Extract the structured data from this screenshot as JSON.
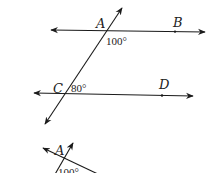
{
  "diagram": {
    "type": "parallel-lines-transversal",
    "lines": [
      {
        "name": "line-AB",
        "points": [
          "A",
          "B"
        ]
      },
      {
        "name": "line-CD",
        "points": [
          "C",
          "D"
        ]
      },
      {
        "name": "transversal",
        "points": [
          "A",
          "C"
        ]
      }
    ],
    "labels": {
      "A": "A",
      "B": "B",
      "C": "C",
      "D": "D"
    },
    "angles": {
      "angle_A": "100°",
      "angle_C": "80°"
    },
    "fragment": {
      "label_A": "A",
      "angle": "100°"
    }
  }
}
